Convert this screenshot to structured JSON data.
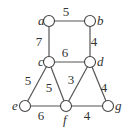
{
  "graph": {
    "nodes": [
      {
        "id": "a",
        "label": "a",
        "x": 49,
        "y": 21,
        "lx": 38,
        "ly": 25
      },
      {
        "id": "b",
        "label": "b",
        "x": 90,
        "y": 21,
        "lx": 97,
        "ly": 25
      },
      {
        "id": "c",
        "label": "c",
        "x": 49,
        "y": 62,
        "lx": 38,
        "ly": 66
      },
      {
        "id": "d",
        "label": "d",
        "x": 90,
        "y": 62,
        "lx": 97,
        "ly": 66
      },
      {
        "id": "e",
        "label": "e",
        "x": 25,
        "y": 106,
        "lx": 12,
        "ly": 110
      },
      {
        "id": "f",
        "label": "f",
        "x": 66,
        "y": 106,
        "lx": 63,
        "ly": 124
      },
      {
        "id": "g",
        "label": "g",
        "x": 108,
        "y": 106,
        "lx": 115,
        "ly": 110
      }
    ],
    "edges": [
      {
        "from": "a",
        "to": "b",
        "weight": "5",
        "wx": 66,
        "wy": 16
      },
      {
        "from": "a",
        "to": "c",
        "weight": "7",
        "wx": 39,
        "wy": 46
      },
      {
        "from": "b",
        "to": "d",
        "weight": "4",
        "wx": 94,
        "wy": 46
      },
      {
        "from": "c",
        "to": "d",
        "weight": "6",
        "wx": 65,
        "wy": 57
      },
      {
        "from": "c",
        "to": "e",
        "weight": "5",
        "wx": 28,
        "wy": 85
      },
      {
        "from": "c",
        "to": "f",
        "weight": "5",
        "wx": 49,
        "wy": 92
      },
      {
        "from": "d",
        "to": "f",
        "weight": "3",
        "wx": 71,
        "wy": 84
      },
      {
        "from": "d",
        "to": "g",
        "weight": "4",
        "wx": 104,
        "wy": 92
      },
      {
        "from": "e",
        "to": "f",
        "weight": "6",
        "wx": 41,
        "wy": 120
      },
      {
        "from": "f",
        "to": "g",
        "weight": "4",
        "wx": 87,
        "wy": 120
      }
    ]
  }
}
